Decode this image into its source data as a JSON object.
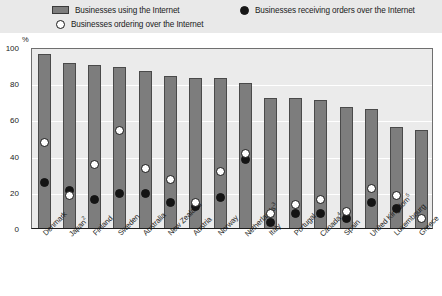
{
  "legend": {
    "items": [
      {
        "marker": "bar-swatch",
        "label": "Businesses using the Internet"
      },
      {
        "marker": "open-circle",
        "label": "Businesses ordering over the Internet"
      },
      {
        "marker": "filled-circle",
        "label": "Businesses receiving orders over the Internet"
      }
    ]
  },
  "axis": {
    "unit": "%",
    "yticks": [
      "100",
      "80",
      "60",
      "40",
      "20",
      "0"
    ]
  },
  "chart_data": {
    "type": "bar",
    "title": "",
    "xlabel": "",
    "ylabel": "%",
    "ylim": [
      0,
      100
    ],
    "yticks": [
      0,
      20,
      40,
      60,
      80,
      100
    ],
    "grid": true,
    "legend_position": "top",
    "categories": [
      "Denmark",
      "Japan2",
      "Finland",
      "Sweden",
      "Australia",
      "New Zealand",
      "Austria",
      "Norway",
      "Netherlands3",
      "Italy",
      "Portugal",
      "Canada4",
      "Spain",
      "United Kingdom5",
      "Luxembourg",
      "Greece"
    ],
    "category_labels": [
      {
        "name": "Denmark",
        "sup": ""
      },
      {
        "name": "Japan",
        "sup": "2"
      },
      {
        "name": "Finland",
        "sup": ""
      },
      {
        "name": "Sweden",
        "sup": ""
      },
      {
        "name": "Australia",
        "sup": ""
      },
      {
        "name": "New Zealand",
        "sup": ""
      },
      {
        "name": "Austria",
        "sup": ""
      },
      {
        "name": "Norway",
        "sup": ""
      },
      {
        "name": "Netherlands",
        "sup": "3"
      },
      {
        "name": "Italy",
        "sup": ""
      },
      {
        "name": "Portugal",
        "sup": ""
      },
      {
        "name": "Canada",
        "sup": "4"
      },
      {
        "name": "Spain",
        "sup": ""
      },
      {
        "name": "United Kingdom",
        "sup": "5"
      },
      {
        "name": "Luxembourg",
        "sup": ""
      },
      {
        "name": "Greece",
        "sup": ""
      }
    ],
    "series": [
      {
        "name": "Businesses using the Internet",
        "type": "bar",
        "color": "#7d7d7d",
        "values": [
          96,
          91,
          90,
          89,
          87,
          84,
          83,
          83,
          80,
          72,
          72,
          71,
          67,
          66,
          56,
          54
        ]
      },
      {
        "name": "Businesses ordering over the Internet",
        "type": "scatter",
        "marker": "open-circle",
        "color": "#ffffff",
        "values": [
          47,
          18,
          35,
          54,
          33,
          27,
          14,
          31,
          41,
          8,
          13,
          16,
          9,
          22,
          18,
          5
        ]
      },
      {
        "name": "Businesses receiving orders over the Internet",
        "type": "scatter",
        "marker": "filled-circle",
        "color": "#141414",
        "values": [
          25,
          21,
          16,
          19,
          19,
          14,
          12,
          17,
          38,
          3,
          8,
          8,
          5,
          14,
          11,
          null
        ]
      }
    ]
  }
}
